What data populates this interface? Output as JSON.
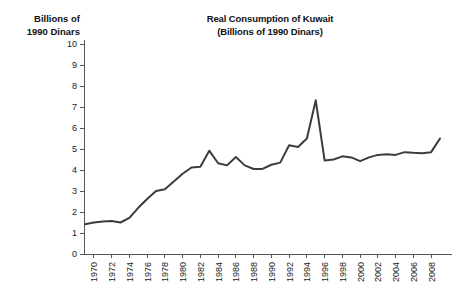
{
  "chart_data": {
    "type": "line",
    "title": "Real Consumption of Kuwait",
    "subtitle": "(Billions of 1990 Dinars)",
    "ylabel_line1": "Billions of",
    "ylabel_line2": "1990 Dinars",
    "xlabel": "",
    "ylim": [
      0,
      10
    ],
    "xlim": [
      1969,
      2009
    ],
    "yticks": [
      0,
      1,
      2,
      3,
      4,
      5,
      6,
      7,
      8,
      9,
      10
    ],
    "ytick_labels": [
      "0",
      "1",
      "2",
      "3",
      "4",
      "5",
      "6",
      "7",
      "8",
      "9",
      "10"
    ],
    "xticks": [
      1970,
      1972,
      1974,
      1976,
      1978,
      1980,
      1982,
      1984,
      1986,
      1988,
      1990,
      1992,
      1994,
      1996,
      1998,
      2000,
      2002,
      2004,
      2006,
      2008
    ],
    "xtick_labels": [
      "1970",
      "1972",
      "1974",
      "1976",
      "1978",
      "1980",
      "1982",
      "1984",
      "1986",
      "1988",
      "1990",
      "1992",
      "1994",
      "1996",
      "1998",
      "2000",
      "2002",
      "2004",
      "2006",
      "2008"
    ],
    "grid": false,
    "legend": false,
    "line_color": "#3c3c3c",
    "axis_color": "#555555",
    "background_color": "#ffffff",
    "series": [
      {
        "name": "Real Consumption of Kuwait",
        "x": [
          1969,
          1970,
          1971,
          1972,
          1973,
          1974,
          1975,
          1976,
          1977,
          1978,
          1979,
          1980,
          1981,
          1982,
          1983,
          1984,
          1985,
          1986,
          1987,
          1988,
          1989,
          1990,
          1991,
          1992,
          1993,
          1994,
          1995,
          1996,
          1997,
          1998,
          1999,
          2000,
          2001,
          2002,
          2003,
          2004,
          2005,
          2006,
          2007,
          2008,
          2009
        ],
        "values": [
          1.42,
          1.5,
          1.55,
          1.57,
          1.5,
          1.72,
          2.2,
          2.62,
          3.0,
          3.08,
          3.45,
          3.82,
          4.12,
          4.15,
          4.92,
          4.32,
          4.22,
          4.62,
          4.22,
          4.05,
          4.05,
          4.25,
          4.35,
          5.18,
          5.1,
          5.5,
          7.32,
          4.45,
          4.5,
          4.65,
          4.6,
          4.42,
          4.6,
          4.72,
          4.75,
          4.72,
          4.85,
          4.82,
          4.8,
          4.85,
          5.5
        ]
      }
    ],
    "annotations": []
  },
  "axes_geometry": {
    "note": "pixel mapping used for rendering only"
  }
}
